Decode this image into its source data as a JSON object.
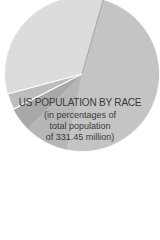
{
  "chart_data": {
    "type": "pie",
    "title": "US POPULATION BY RACE",
    "subtitle_lines": [
      "(in percentages of",
      "total population",
      "of 331.45 million)"
    ],
    "total_population_millions": 331.45,
    "slices": [
      {
        "label": "",
        "value": 40.0,
        "color": "#dcdcdc"
      },
      {
        "label": "",
        "value": 58.0,
        "color": "#c4c4c4"
      },
      {
        "label": "",
        "value": 11.0,
        "color": "#b6b6b6"
      },
      {
        "label": "",
        "value": 6.0,
        "color": "#a8a8a8"
      },
      {
        "label": "",
        "value": 4.0,
        "color": "#bdbdbd"
      }
    ],
    "start_angle_deg": -105,
    "legend": "none",
    "note": "Slice values estimated from arc angles; no value labels visible in crop"
  },
  "labels": {
    "title": "US POPULATION BY RACE",
    "line2": "(in percentages of",
    "line3": "total population",
    "line4": "of 331.45 million)"
  }
}
